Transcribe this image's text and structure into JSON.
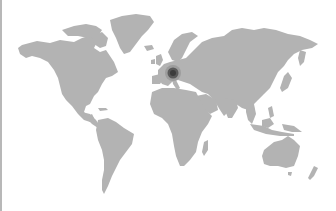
{
  "map": {
    "type": "world-map",
    "projection": "miller-like",
    "land_color": "#b3b3b3",
    "background_color": "#ffffff",
    "border_left_color": "#b8b8b8",
    "markers": [
      {
        "region": "Central Europe",
        "x": 171,
        "y": 73,
        "radius": 7,
        "color": "#4a4a4a"
      }
    ]
  }
}
